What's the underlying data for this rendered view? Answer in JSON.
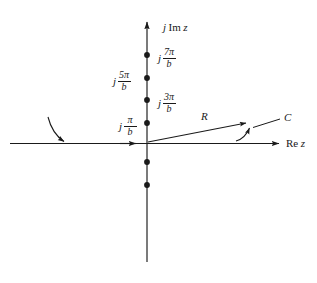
{
  "figure": {
    "type": "complex-plane-contour-diagram",
    "background": "#ffffff",
    "ink_color": "#1a1a1a",
    "width": 317,
    "height": 283
  },
  "axes": {
    "imaginary": {
      "label_j": "j",
      "label_op": "Im",
      "label_z": "z",
      "full_label": "j Im z",
      "orientation": "vertical",
      "arrow": "up",
      "x_px": 147,
      "y_top_px": 18,
      "y_bottom_px": 262
    },
    "real": {
      "label_op": "Re",
      "label_z": "z",
      "full_label": "Re z",
      "orientation": "horizontal",
      "arrow": "right",
      "y_px": 143,
      "x_left_px": 10,
      "x_right_px": 283
    }
  },
  "poles": [
    {
      "name": "pole-7pi-b",
      "labeled": true,
      "label_side": "right",
      "numerator": "7π",
      "denominator": "b",
      "j": "j",
      "y_px": 55
    },
    {
      "name": "pole-5pi-b",
      "labeled": true,
      "label_side": "left",
      "numerator": "5π",
      "denominator": "b",
      "j": "j",
      "y_px": 78
    },
    {
      "name": "pole-3pi-b",
      "labeled": true,
      "label_side": "right",
      "numerator": "3π",
      "denominator": "b",
      "j": "j",
      "y_px": 100
    },
    {
      "name": "pole-pi-b",
      "labeled": true,
      "label_side": "left",
      "numerator": "π",
      "denominator": "b",
      "j": "j",
      "y_px": 123
    },
    {
      "name": "pole-lower-1",
      "labeled": false,
      "y_px": 162
    },
    {
      "name": "pole-lower-2",
      "labeled": false,
      "y_px": 185
    }
  ],
  "annotations": {
    "radius": {
      "label": "R",
      "x_px": 204,
      "y_px": 118
    },
    "contour": {
      "label": "C",
      "x_px": 285,
      "y_px": 124
    }
  },
  "contour": {
    "name": "contour-C",
    "description": "path along real axis with arrowheads, radius line R and small hook arrow near C"
  }
}
